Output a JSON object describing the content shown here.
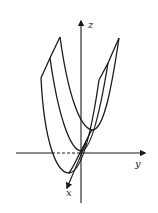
{
  "figure": {
    "type": "3d-surface-sketch",
    "axes": {
      "z": {
        "label": "z"
      },
      "y": {
        "label": "y"
      },
      "x": {
        "label": "x"
      }
    },
    "cross_sections": [
      {
        "name": "back-parabola"
      },
      {
        "name": "middle-parabola"
      },
      {
        "name": "front-parabola"
      }
    ],
    "colors": {
      "stroke": "#1a1a1a",
      "background": "#ffffff"
    }
  }
}
